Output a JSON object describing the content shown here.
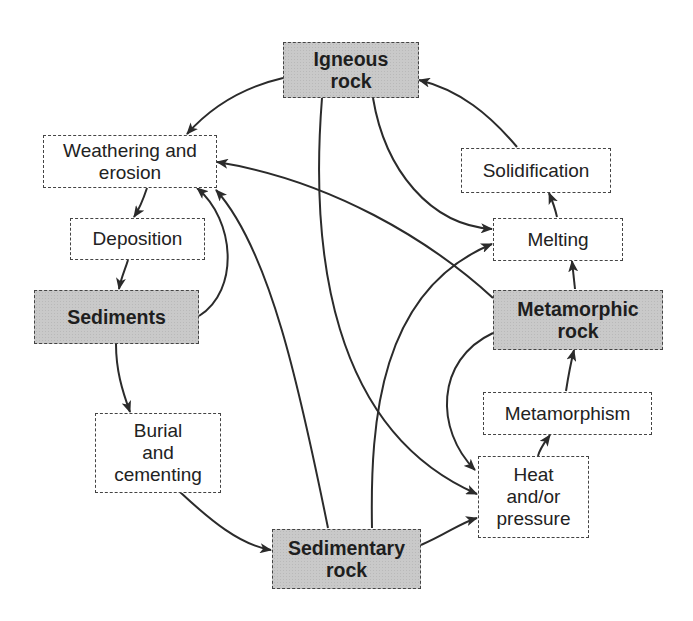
{
  "diagram": {
    "nodes": {
      "igneous": {
        "label": "Igneous\nrock",
        "type": "rock"
      },
      "weathering": {
        "label": "Weathering and\nerosion",
        "type": "process"
      },
      "deposition": {
        "label": "Deposition",
        "type": "process"
      },
      "sediments": {
        "label": "Sediments",
        "type": "rock"
      },
      "burial": {
        "label": "Burial\nand\ncementing",
        "type": "process"
      },
      "sedimentary": {
        "label": "Sedimentary\nrock",
        "type": "rock"
      },
      "heat": {
        "label": "Heat\nand/or\npressure",
        "type": "process"
      },
      "metamorphism": {
        "label": "Metamorphism",
        "type": "process"
      },
      "metamorphic": {
        "label": "Metamorphic\nrock",
        "type": "rock"
      },
      "melting": {
        "label": "Melting",
        "type": "process"
      },
      "solidification": {
        "label": "Solidification",
        "type": "process"
      }
    },
    "edges": [
      {
        "from": "Igneous rock",
        "to": "Weathering and erosion"
      },
      {
        "from": "Igneous rock",
        "to": "Melting"
      },
      {
        "from": "Igneous rock",
        "to": "Heat and/or pressure"
      },
      {
        "from": "Weathering and erosion",
        "to": "Deposition"
      },
      {
        "from": "Deposition",
        "to": "Sediments"
      },
      {
        "from": "Sediments",
        "to": "Weathering and erosion"
      },
      {
        "from": "Sediments",
        "to": "Burial and cementing"
      },
      {
        "from": "Burial and cementing",
        "to": "Sedimentary rock"
      },
      {
        "from": "Sedimentary rock",
        "to": "Weathering and erosion"
      },
      {
        "from": "Sedimentary rock",
        "to": "Melting"
      },
      {
        "from": "Sedimentary rock",
        "to": "Heat and/or pressure"
      },
      {
        "from": "Heat and/or pressure",
        "to": "Metamorphism"
      },
      {
        "from": "Metamorphism",
        "to": "Metamorphic rock"
      },
      {
        "from": "Metamorphic rock",
        "to": "Melting"
      },
      {
        "from": "Metamorphic rock",
        "to": "Weathering and erosion"
      },
      {
        "from": "Metamorphic rock",
        "to": "Heat and/or pressure"
      },
      {
        "from": "Melting",
        "to": "Solidification"
      },
      {
        "from": "Solidification",
        "to": "Igneous rock"
      }
    ],
    "colors": {
      "rock_fill": "#c9c9c9",
      "process_fill": "#ffffff",
      "stroke": "#2b2b2b"
    }
  }
}
